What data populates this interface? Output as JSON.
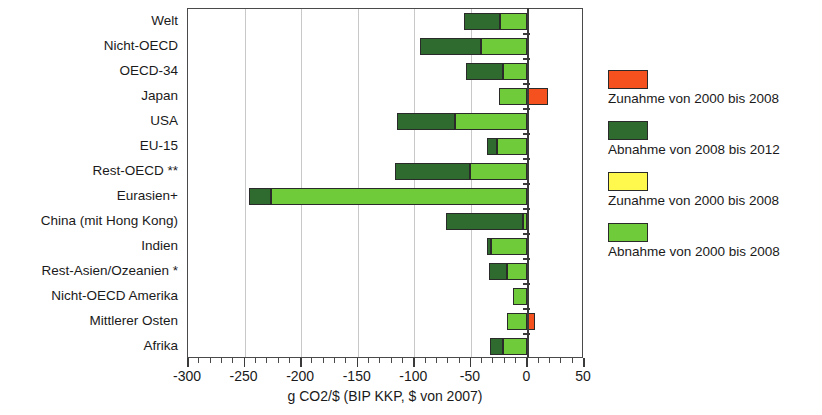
{
  "chart_data": {
    "type": "bar",
    "orientation": "horizontal",
    "stacked": true,
    "title": "",
    "xlabel": "g CO2/$ (BIP KKP, $ von 2007)",
    "ylabel": "",
    "xlim": [
      -300,
      50
    ],
    "xticks": [
      -300,
      -250,
      -200,
      -150,
      -100,
      -50,
      0,
      50
    ],
    "xtick_labels": [
      "-300",
      "-250",
      "-200",
      "-150",
      "-100",
      "-50",
      "0",
      "50"
    ],
    "minor_tick_step": 10,
    "grid": "vertical",
    "legend_position": "right",
    "categories": [
      "Welt",
      "Nicht-OECD",
      "OECD-34",
      "Japan",
      "USA",
      "EU-15",
      "Rest-OECD **",
      "Eurasien+",
      "China (mit Hong Kong)",
      "Indien",
      "Rest-Asien/Ozeanien *",
      "Nicht-OECD Amerika",
      "Mittlerer Osten",
      "Afrika"
    ],
    "series": [
      {
        "name": "Abnahme von 2000 bis 2008",
        "color": "#6FCB3A",
        "values": [
          -24,
          -41,
          -22,
          -25,
          -64,
          -27,
          -51,
          -227,
          -4,
          -32,
          -18,
          -13,
          -18,
          -22
        ]
      },
      {
        "name": "Abnahme von 2008 bis 2012",
        "color": "#2F6B2F",
        "values": [
          -32,
          -54,
          -32,
          0,
          -51,
          -9,
          -66,
          -19,
          -68,
          -4,
          -16,
          0,
          0,
          -11
        ]
      },
      {
        "name": "Zunahme von 2000 bis 2008",
        "color": "#F4511E",
        "values": [
          0,
          0,
          0,
          18,
          0,
          0,
          0,
          0,
          0,
          0,
          0,
          0,
          7,
          0
        ]
      },
      {
        "name": "Zunahme von 2000 bis 2008 (gelb)",
        "color": "#FFF84D",
        "values": [
          0,
          0,
          0,
          0,
          0,
          0,
          0,
          0,
          0,
          0,
          0,
          0,
          0,
          0
        ]
      }
    ]
  },
  "legend": {
    "items": [
      {
        "label": "Zunahme von 2000 bis 2008",
        "color": "#F4511E"
      },
      {
        "label": "Abnahme von 2008 bis 2012",
        "color": "#2F6B2F"
      },
      {
        "label": "Zunahme von 2000 bis 2008",
        "color": "#FFF84D"
      },
      {
        "label": "Abnahme von 2000 bis 2008",
        "color": "#6FCB3A"
      }
    ]
  },
  "axis": {
    "x_title": "g CO2/$ (BIP KKP, $ von 2007)"
  }
}
